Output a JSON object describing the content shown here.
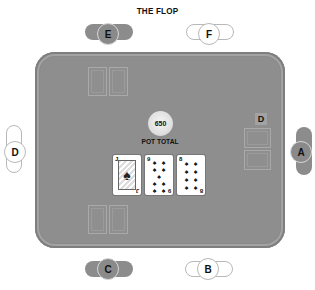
{
  "title": "THE FLOP",
  "pot": {
    "amount": "650",
    "label": "POT TOTAL"
  },
  "dealer_button": "D",
  "seats": [
    {
      "id": "A",
      "label": "A",
      "style": "dark",
      "position": "right"
    },
    {
      "id": "B",
      "label": "B",
      "style": "light",
      "position": "bottom-right"
    },
    {
      "id": "C",
      "label": "C",
      "style": "dark",
      "position": "bottom-left"
    },
    {
      "id": "D",
      "label": "D",
      "style": "light",
      "position": "left"
    },
    {
      "id": "E",
      "label": "E",
      "style": "dark",
      "position": "top-left"
    },
    {
      "id": "F",
      "label": "F",
      "style": "light",
      "position": "top-right"
    }
  ],
  "community_cards": [
    {
      "rank": "J",
      "suit": "♠",
      "suit_name": "spades"
    },
    {
      "rank": "9",
      "suit": "♠",
      "suit_name": "spades"
    },
    {
      "rank": "8",
      "suit": "♠",
      "suit_name": "spades"
    }
  ],
  "colors": {
    "felt": "#8e8e8e",
    "seat_dark": "#8c8c8c",
    "seat_light": "#ffffff"
  }
}
